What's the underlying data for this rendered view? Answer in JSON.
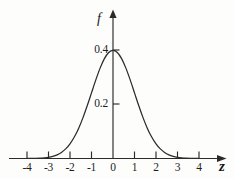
{
  "figure": {
    "kind": "normal-distribution-plot",
    "background_color": "#fdfdfc",
    "ink_color": "#2b2b2b"
  },
  "axes": {
    "x_axis_title": "z",
    "y_axis_title": "f",
    "x_tick_labels": [
      "-4",
      "-3",
      "-2",
      "-1",
      "0",
      "1",
      "2",
      "3",
      "4"
    ],
    "y_tick_labels": [
      "0.2",
      "0.4"
    ]
  },
  "chart_data": {
    "type": "line",
    "title": "",
    "subtitle": "",
    "xlabel": "z",
    "ylabel": "f",
    "xlim": [
      -4.4,
      4.6
    ],
    "ylim": [
      0,
      0.47
    ],
    "xticks": [
      -4,
      -3,
      -2,
      -1,
      0,
      1,
      2,
      3,
      4
    ],
    "xticklabels": [
      "-4",
      "-3",
      "-2",
      "-1",
      "0",
      "1",
      "2",
      "3",
      "4"
    ],
    "yticks": [
      0.2,
      0.4
    ],
    "yticklabels": [
      "0.2",
      "0.4"
    ],
    "grid": false,
    "legend": null,
    "annotations": [],
    "series": [
      {
        "name": "standard normal density",
        "formula": "f(z) = (1/sqrt(2*pi)) * exp(-z^2/2)",
        "x": [
          -4.0,
          -3.8,
          -3.6,
          -3.4,
          -3.2,
          -3.0,
          -2.8,
          -2.6,
          -2.4,
          -2.2,
          -2.0,
          -1.8,
          -1.6,
          -1.4,
          -1.2,
          -1.0,
          -0.8,
          -0.6,
          -0.4,
          -0.2,
          0.0,
          0.2,
          0.4,
          0.6,
          0.8,
          1.0,
          1.2,
          1.4,
          1.6,
          1.8,
          2.0,
          2.2,
          2.4,
          2.6,
          2.8,
          3.0,
          3.2,
          3.4,
          3.6,
          3.8,
          4.0
        ],
        "y": [
          0.0001,
          0.0003,
          0.0006,
          0.0012,
          0.0024,
          0.0044,
          0.0079,
          0.0136,
          0.0224,
          0.0355,
          0.054,
          0.079,
          0.1109,
          0.1497,
          0.1942,
          0.242,
          0.2897,
          0.3332,
          0.3683,
          0.391,
          0.3989,
          0.391,
          0.3683,
          0.3332,
          0.2897,
          0.242,
          0.1942,
          0.1497,
          0.1109,
          0.079,
          0.054,
          0.0355,
          0.0224,
          0.0136,
          0.0079,
          0.0044,
          0.0024,
          0.0012,
          0.0006,
          0.0003,
          0.0001
        ],
        "peak_x": 0,
        "peak_y": 0.3989
      }
    ]
  },
  "geometry": {
    "origin_px": {
      "x": 113,
      "y": 158.5
    },
    "x_unit_px": 21.5,
    "y_value_0p2_px": 104,
    "y_value_0p4_px": 50
  }
}
